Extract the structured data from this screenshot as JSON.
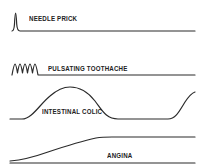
{
  "diagram": {
    "line_color": "#2a2a2a",
    "panels": [
      {
        "id": "needle-prick",
        "label": "NEEDLE PRICK",
        "pattern": "single sharp spike"
      },
      {
        "id": "pulsating-toothache",
        "label": "PULSATING TOOTHACHE",
        "pattern": "repeated rhythmic spikes"
      },
      {
        "id": "intestinal-colic",
        "label": "INTESTINAL COLIC",
        "pattern": "slow waves rising and falling"
      },
      {
        "id": "angina",
        "label": "ANGINA",
        "pattern": "gradual rise to sustained plateau"
      }
    ]
  }
}
